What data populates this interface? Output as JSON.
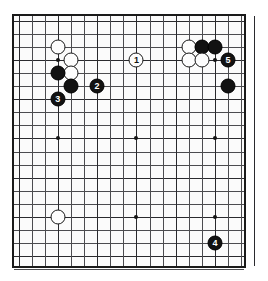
{
  "figure": {
    "kind": "go-board-diagram",
    "board_size": 19,
    "visible_cols": 18,
    "visible_rows": 19,
    "colors": {
      "board": "#fbfbfb",
      "frame": "#1a1a1a",
      "grid": "#4c4c50",
      "black_stone": "#121212",
      "white_stone": "#fdfdfd"
    }
  },
  "labels": [
    {
      "text": "A",
      "col": 1,
      "row": 2
    },
    {
      "text": "C",
      "col": 6,
      "row": 2
    },
    {
      "text": "B",
      "col": 11,
      "row": 1
    }
  ],
  "hoshi": [
    {
      "col": 3,
      "row": 3
    },
    {
      "col": 9,
      "row": 3
    },
    {
      "col": 15,
      "row": 3
    },
    {
      "col": 3,
      "row": 9
    },
    {
      "col": 9,
      "row": 9
    },
    {
      "col": 15,
      "row": 9
    },
    {
      "col": 3,
      "row": 15
    },
    {
      "col": 9,
      "row": 15
    },
    {
      "col": 15,
      "row": 15
    }
  ],
  "stones": [
    {
      "color": "white",
      "col": 3,
      "row": 2,
      "num": ""
    },
    {
      "color": "white",
      "col": 4,
      "row": 3,
      "num": ""
    },
    {
      "color": "white",
      "col": 4,
      "row": 4,
      "num": ""
    },
    {
      "color": "black",
      "col": 3,
      "row": 4,
      "num": ""
    },
    {
      "color": "black",
      "col": 4,
      "row": 5,
      "num": ""
    },
    {
      "color": "black",
      "col": 3,
      "row": 6,
      "num": "3"
    },
    {
      "color": "black",
      "col": 6,
      "row": 5,
      "num": "2"
    },
    {
      "color": "white",
      "col": 9,
      "row": 3,
      "num": "1"
    },
    {
      "color": "white",
      "col": 13,
      "row": 2,
      "num": ""
    },
    {
      "color": "black",
      "col": 14,
      "row": 2,
      "num": ""
    },
    {
      "color": "black",
      "col": 15,
      "row": 2,
      "num": ""
    },
    {
      "color": "white",
      "col": 13,
      "row": 3,
      "num": ""
    },
    {
      "color": "white",
      "col": 14,
      "row": 3,
      "num": ""
    },
    {
      "color": "black",
      "col": 16,
      "row": 3,
      "num": "5"
    },
    {
      "color": "black",
      "col": 16,
      "row": 5,
      "num": ""
    },
    {
      "color": "white",
      "col": 3,
      "row": 15,
      "num": ""
    },
    {
      "color": "black",
      "col": 15,
      "row": 17,
      "num": "4"
    }
  ]
}
